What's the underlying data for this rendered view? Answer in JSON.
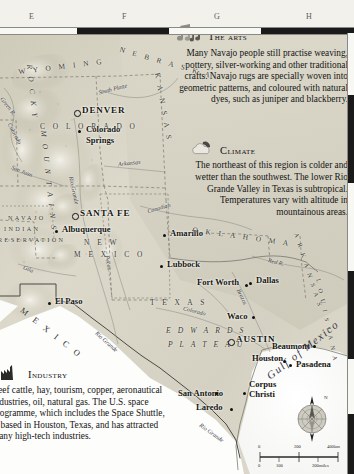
{
  "page": {
    "type": "atlas-map",
    "region": "Southwestern United States and Texas"
  },
  "grid": {
    "columns": [
      "E",
      "F",
      "G",
      "H"
    ],
    "top_letters": [
      "E",
      "F",
      "G",
      "H"
    ]
  },
  "infoboxes": [
    {
      "id": "arts",
      "icon": "music-note-icon",
      "heading": "The arts",
      "body": "Many Navajo people still practise weaving, pottery, silver-working and other traditional crafts. Navajo rugs are specially woven into geometric patterns, and coloured with natural dyes, such as juniper and blackberry."
    },
    {
      "id": "climate",
      "icon": "cloud-sun-icon",
      "heading": "Climate",
      "body": "The northeast of this region is colder and wetter than the southwest. The lower Rio Grande Valley in Texas is subtropical. Temperatures vary with altitude in mountainous areas."
    },
    {
      "id": "industry",
      "icon": "factory-icon",
      "heading": "Industry",
      "body": "Beef cattle, hay, tourism, copper, aeronautical industries, oil, natural gas. The U.S. space programme, which includes the Space Shuttle, is based in Houston, Texas, and has attracted many high-tech industries."
    }
  ],
  "map_labels": {
    "capitals": [
      {
        "name": "DENVER",
        "x": 84,
        "y": 110
      },
      {
        "name": "SANTA FE",
        "x": 82,
        "y": 213
      },
      {
        "name": "AUSTIN",
        "x": 236,
        "y": 338
      }
    ],
    "cities": [
      {
        "name": "Colorado Springs",
        "x": 86,
        "y": 128
      },
      {
        "name": "Albuquerque",
        "x": 63,
        "y": 228
      },
      {
        "name": "Amarillo",
        "x": 171,
        "y": 232
      },
      {
        "name": "Lubbock",
        "x": 168,
        "y": 263
      },
      {
        "name": "El Paso",
        "x": 56,
        "y": 300
      },
      {
        "name": "Fort Worth",
        "x": 196,
        "y": 281
      },
      {
        "name": "Dallas",
        "x": 254,
        "y": 278
      },
      {
        "name": "Waco",
        "x": 226,
        "y": 314
      },
      {
        "name": "Beaumont",
        "x": 272,
        "y": 345
      },
      {
        "name": "Houston",
        "x": 252,
        "y": 356
      },
      {
        "name": "Pasadena",
        "x": 296,
        "y": 363
      },
      {
        "name": "San Antonio",
        "x": 178,
        "y": 397
      },
      {
        "name": "Corpus Christi",
        "x": 248,
        "y": 385
      },
      {
        "name": "Laredo",
        "x": 197,
        "y": 406
      }
    ],
    "states": [
      {
        "name": "W Y O M I N G",
        "x": 22,
        "y": 66
      },
      {
        "name": "N E B R A S K A",
        "x": 122,
        "y": 62
      },
      {
        "name": "C O L O R A D O",
        "x": 43,
        "y": 126
      },
      {
        "name": "K A N S A S",
        "x": 165,
        "y": 76
      },
      {
        "name": "N E W",
        "x": 86,
        "y": 240
      },
      {
        "name": "M E X I C O",
        "x": 78,
        "y": 252
      },
      {
        "name": "O K L A H O M A",
        "x": 200,
        "y": 235
      },
      {
        "name": "A R K A N S A S",
        "x": 300,
        "y": 238
      },
      {
        "name": "L O U I S I A N A",
        "x": 318,
        "y": 280
      },
      {
        "name": "T E X A S",
        "x": 160,
        "y": 300
      }
    ],
    "regions": [
      {
        "name": "R O C K Y",
        "x": 36,
        "y": 70
      },
      {
        "name": "M O U N T A I N S",
        "x": 46,
        "y": 140
      },
      {
        "name": "NAVAJO",
        "x": 10,
        "y": 218
      },
      {
        "name": "INDIAN",
        "x": 6,
        "y": 228
      },
      {
        "name": "RESERVATION",
        "x": 0,
        "y": 238
      },
      {
        "name": "E D W A R D S",
        "x": 168,
        "y": 329
      },
      {
        "name": "P L A T E A U",
        "x": 170,
        "y": 343
      },
      {
        "name": "M E X I C O",
        "x": 28,
        "y": 312
      }
    ],
    "rivers": [
      {
        "name": "Green R.",
        "x": 8,
        "y": 98
      },
      {
        "name": "South Platte",
        "x": 100,
        "y": 88
      },
      {
        "name": "Colorado",
        "x": 15,
        "y": 128
      },
      {
        "name": "Arkansas",
        "x": 120,
        "y": 163
      },
      {
        "name": "San Juan",
        "x": 13,
        "y": 172
      },
      {
        "name": "Rio Grande",
        "x": 76,
        "y": 180
      },
      {
        "name": "Gila",
        "x": 25,
        "y": 268
      },
      {
        "name": "Canadian",
        "x": 150,
        "y": 208
      },
      {
        "name": "Pecos",
        "x": 110,
        "y": 258
      },
      {
        "name": "Red R.",
        "x": 270,
        "y": 262
      },
      {
        "name": "Brazos",
        "x": 243,
        "y": 291
      },
      {
        "name": "Colorado",
        "x": 185,
        "y": 312
      },
      {
        "name": "Rio Grande",
        "x": 100,
        "y": 333
      },
      {
        "name": "Rio Grande",
        "x": 204,
        "y": 425
      }
    ],
    "water_bodies": [
      {
        "name": "Gulf of Mexico",
        "x": 272,
        "y": 372
      }
    ]
  },
  "compass": {
    "label": "N",
    "name": "compass-rose"
  },
  "scale": {
    "km": {
      "ticks": [
        "0",
        "200",
        "400km"
      ]
    },
    "miles": {
      "ticks": [
        "0",
        "100",
        "200miles"
      ]
    }
  },
  "colors": {
    "land_low": "#d9d6c8",
    "land_mid": "#c9c5b4",
    "highland": "#e8e5da",
    "water": "#ffffff",
    "grid_dark": "#1a1a1a",
    "text": "#141414"
  }
}
